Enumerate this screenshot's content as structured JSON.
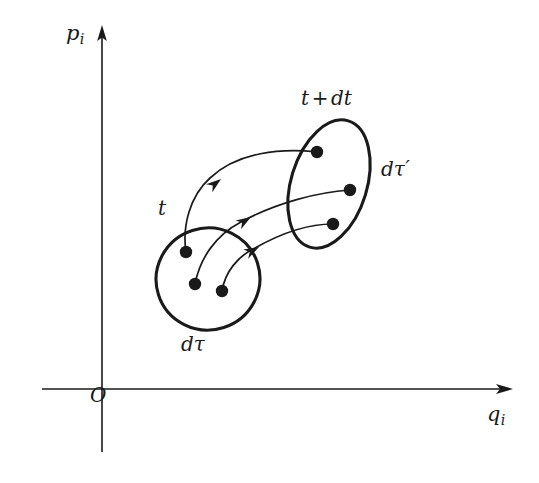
{
  "figure": {
    "background_color": "#ffffff",
    "ink_color": "#1a1a1a",
    "width": 539,
    "height": 483
  },
  "axes": {
    "vertical": {
      "label_base": "p",
      "label_sub": "i",
      "arrow_direction": "up",
      "x": 102,
      "top_y": 28,
      "bottom_y": 452
    },
    "horizontal": {
      "label_base": "q",
      "label_sub": "i",
      "arrow_direction": "right",
      "y": 389,
      "left_x": 42,
      "right_x": 512
    },
    "origin_label": "O"
  },
  "regions": [
    {
      "name": "initial-volume",
      "time_label": "t",
      "volume_label_base": "d",
      "volume_label_greek": "τ",
      "volume_label_prime": "",
      "center_x": 208,
      "center_y": 279,
      "radius_x": 52,
      "radius_y": 51,
      "rotation_deg": -18,
      "points": [
        {
          "x": 186,
          "y": 252
        },
        {
          "x": 195,
          "y": 284
        },
        {
          "x": 222,
          "y": 291
        }
      ]
    },
    {
      "name": "evolved-volume",
      "time_label_base": "t",
      "time_label_op": "+",
      "time_label_tail": "dt",
      "volume_label_base": "d",
      "volume_label_greek": "τ",
      "volume_label_prime": "′",
      "center_x": 329,
      "center_y": 184,
      "radius_x": 38,
      "radius_y": 66,
      "rotation_deg": 17,
      "points": [
        {
          "x": 317,
          "y": 152
        },
        {
          "x": 350,
          "y": 190
        },
        {
          "x": 333,
          "y": 224
        }
      ]
    }
  ],
  "trajectories": [
    {
      "name": "trajectory-1",
      "from": {
        "x": 186,
        "y": 252
      },
      "to": {
        "x": 317,
        "y": 152
      },
      "arrow_at": {
        "x": 221,
        "y": 179
      },
      "path": "M186,252 C182,226 190,196 210,178 C238,152 281,148 317,152",
      "arrow_rotation_deg": -38
    },
    {
      "name": "trajectory-2",
      "from": {
        "x": 195,
        "y": 284
      },
      "to": {
        "x": 350,
        "y": 190
      },
      "arrow_at": {
        "x": 251,
        "y": 217
      },
      "path": "M195,284 C200,258 216,235 241,222 C276,203 318,192 350,190",
      "arrow_rotation_deg": -32
    },
    {
      "name": "trajectory-3",
      "from": {
        "x": 222,
        "y": 291
      },
      "to": {
        "x": 333,
        "y": 224
      },
      "arrow_at": {
        "x": 259,
        "y": 247
      },
      "path": "M222,291 C225,272 238,256 255,248 C285,231 312,224 333,224",
      "arrow_rotation_deg": -28
    }
  ]
}
